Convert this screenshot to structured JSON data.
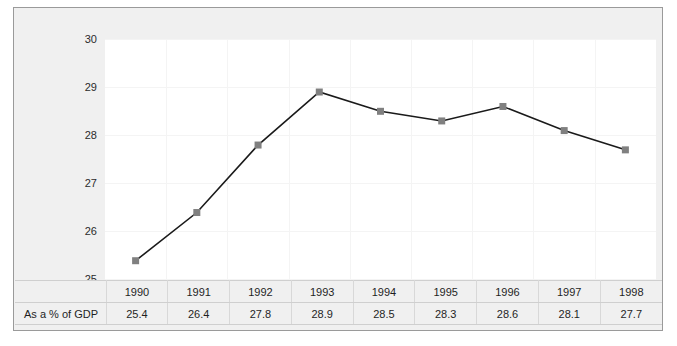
{
  "chart_data": {
    "type": "line",
    "title": "",
    "subtitle": "",
    "xlabel": "",
    "ylabel": "",
    "categories": [
      "1990",
      "1991",
      "1992",
      "1993",
      "1994",
      "1995",
      "1996",
      "1997",
      "1998"
    ],
    "series": [
      {
        "name": "As a % of GDP",
        "values": [
          25.4,
          26.4,
          27.8,
          28.9,
          28.5,
          28.3,
          28.6,
          28.1,
          27.7
        ]
      }
    ],
    "values": [
      25.4,
      26.4,
      27.8,
      28.9,
      28.5,
      28.3,
      28.6,
      28.1,
      27.7
    ],
    "ylim": [
      25,
      30
    ],
    "ytick_labels": [
      "30",
      "29",
      "28",
      "27",
      "26",
      "25"
    ],
    "ytick_values": [
      30,
      29,
      28,
      27,
      26,
      25
    ],
    "grid": true,
    "legend_position": "none",
    "marker": "square",
    "marker_color": "#808080",
    "line_color": "#1a1a1a",
    "plot_background": "#ffffff",
    "figure_background": "#f0f0f0",
    "annotations": []
  },
  "table": {
    "row_label": "As a % of GDP",
    "header": [
      "",
      "1990",
      "1991",
      "1992",
      "1993",
      "1994",
      "1995",
      "1996",
      "1997",
      "1998"
    ],
    "values": [
      "25.4",
      "26.4",
      "27.8",
      "28.9",
      "28.5",
      "28.3",
      "28.6",
      "28.1",
      "27.7"
    ]
  }
}
